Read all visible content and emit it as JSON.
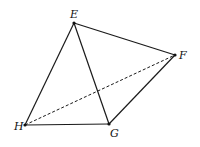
{
  "diagram": {
    "title": "",
    "points": {
      "E": {
        "label": "E",
        "x": 74,
        "y": 23
      },
      "F": {
        "label": "F",
        "x": 175,
        "y": 55
      },
      "G": {
        "label": "G",
        "x": 109,
        "y": 124
      },
      "H": {
        "label": "H",
        "x": 25,
        "y": 125
      }
    },
    "solid_edges": [
      "EF",
      "EH",
      "EG",
      "FG",
      "HG"
    ],
    "dashed_edges": [
      "HF"
    ],
    "stroke_color": "#1a1a1a"
  }
}
